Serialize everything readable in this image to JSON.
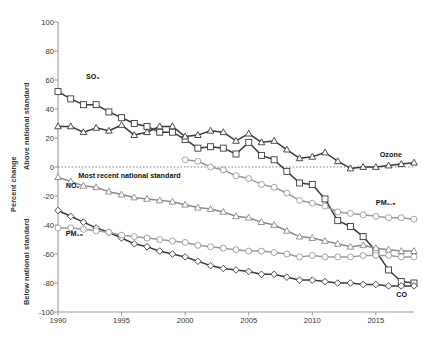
{
  "chart_data": {
    "type": "line",
    "title": "",
    "xlabel": "",
    "ylabel": "Percent change",
    "xlim": [
      1990,
      2018
    ],
    "ylim": [
      -100,
      100
    ],
    "grid": false,
    "legend_position": "inline-series-labels",
    "yticks": [
      100,
      80,
      60,
      40,
      20,
      0,
      -20,
      -40,
      -60,
      -80,
      -100
    ],
    "xticks": [
      1990,
      1995,
      2000,
      2005,
      2010,
      2015
    ],
    "zero_reference_line": 0,
    "annotations": [
      {
        "text": "Most recent national standard",
        "x": 1991.6,
        "y": -6
      }
    ],
    "axis_region_labels": {
      "above": "Above national standard",
      "below": "Below national standard"
    },
    "x": [
      1990,
      1991,
      1992,
      1993,
      1994,
      1995,
      1996,
      1997,
      1998,
      1999,
      2000,
      2001,
      2002,
      2003,
      2004,
      2005,
      2006,
      2007,
      2008,
      2009,
      2010,
      2011,
      2012,
      2013,
      2014,
      2015,
      2016,
      2017,
      2018
    ],
    "series": [
      {
        "name": "SO2",
        "label": "SO₂",
        "marker": "square",
        "color": "#3a3a3a",
        "label_x": 1992.2,
        "label_y": 62,
        "values": [
          52,
          47,
          43,
          43,
          38,
          34,
          30,
          28,
          24,
          24,
          19,
          13,
          14,
          13,
          9,
          17,
          8,
          5,
          -3,
          -11,
          -12,
          -22,
          -37,
          -41,
          -48,
          -58,
          -71,
          -79,
          -80
        ]
      },
      {
        "name": "Ozone",
        "label": "Ozone",
        "marker": "triangle",
        "color": "#3a3a3a",
        "label_x": 2015.3,
        "label_y": 8,
        "values": [
          28,
          28,
          24,
          27,
          25,
          29,
          22,
          24,
          28,
          28,
          21,
          22,
          25,
          24,
          18,
          23,
          17,
          18,
          12,
          6,
          7,
          10,
          4,
          -1,
          0,
          0,
          1,
          2,
          3
        ]
      },
      {
        "name": "NO2",
        "label": "NO₂",
        "marker": "triangle",
        "color": "#8a8a8a",
        "label_x": 1990.6,
        "label_y": -13,
        "values": [
          -7,
          -10,
          -13,
          -14,
          -17,
          -19,
          -21,
          -22,
          -23,
          -24,
          -26,
          -28,
          -29,
          -31,
          -34,
          -35,
          -38,
          -40,
          -44,
          -48,
          -49,
          -51,
          -53,
          -55,
          -54,
          -56,
          -57,
          -58,
          -58
        ]
      },
      {
        "name": "CO",
        "label": "CO",
        "marker": "diamond",
        "color": "#3a3a3a",
        "label_x": 2016.6,
        "label_y": -88,
        "values": [
          -30,
          -34,
          -38,
          -42,
          -45,
          -49,
          -53,
          -55,
          -58,
          -60,
          -62,
          -65,
          -68,
          -70,
          -71,
          -72,
          -74,
          -74,
          -76,
          -78,
          -78,
          -79,
          -80,
          -80,
          -81,
          -81,
          -82,
          -82,
          -82
        ]
      },
      {
        "name": "PM10",
        "label": "PM₁₀",
        "marker": "circle",
        "color": "#9a9a9a",
        "label_x": 1990.6,
        "label_y": -46,
        "values": [
          -42,
          -42,
          -43,
          -44,
          -45,
          -47,
          -48,
          -49,
          -50,
          -51,
          -52,
          -54,
          -55,
          -56,
          -57,
          -58,
          -58,
          -59,
          -60,
          -62,
          -61,
          -62,
          -62,
          -62,
          -61,
          -61,
          -61,
          -62,
          -62
        ]
      },
      {
        "name": "PM2.5",
        "label": "PM₂.₅",
        "marker": "circle",
        "color": "#9a9a9a",
        "label_x": 2015.0,
        "label_y": -25,
        "start_index": 10,
        "values": [
          null,
          null,
          null,
          null,
          null,
          null,
          null,
          null,
          null,
          null,
          5,
          4,
          0,
          -2,
          -6,
          -8,
          -12,
          -14,
          -18,
          -23,
          -25,
          -27,
          -31,
          -32,
          -33,
          -34,
          -35,
          -35,
          -36
        ]
      }
    ]
  }
}
